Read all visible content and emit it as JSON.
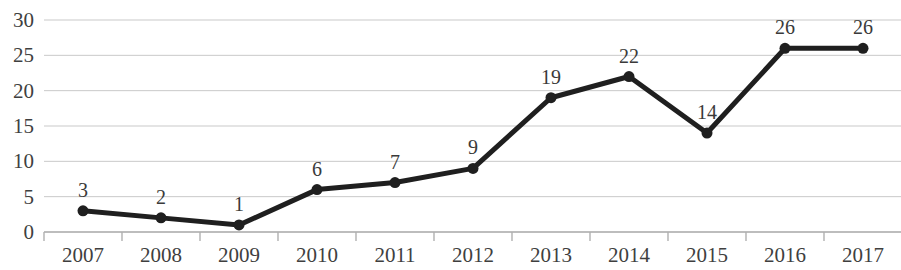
{
  "chart_data": {
    "type": "line",
    "title": "",
    "subtitle": "",
    "xlabel": "",
    "ylabel": "",
    "categories": [
      "2007",
      "2008",
      "2009",
      "2010",
      "2011",
      "2012",
      "2013",
      "2014",
      "2015",
      "2016",
      "2017"
    ],
    "values": [
      3,
      2,
      1,
      6,
      7,
      9,
      19,
      22,
      14,
      26,
      26
    ],
    "data_labels": [
      "3",
      "2",
      "1",
      "6",
      "7",
      "9",
      "19",
      "22",
      "14",
      "26",
      "26"
    ],
    "y_ticks": [
      0,
      5,
      10,
      15,
      20,
      25,
      30
    ],
    "y_tick_labels": [
      "0",
      "5",
      "10",
      "15",
      "20",
      "25",
      "30"
    ],
    "ylim": [
      0,
      30
    ],
    "grid": true,
    "grid_axis": "y",
    "legend": false,
    "legend_position": "none",
    "marker": "circle",
    "line_color": "#1f1f1f",
    "marker_color": "#1f1f1f",
    "grid_color": "#c9c9c9",
    "axis_color": "#b0b0b0",
    "text_color": "#3a3a3a",
    "background_color": "#ffffff"
  },
  "geometry": {
    "plot_left": 44,
    "plot_right": 901,
    "plot_top": 20,
    "plot_bottom": 232,
    "category_step": 78,
    "first_category_center": 83,
    "y_label_right": 34,
    "x_label_baseline_top": 245,
    "tick_length": 9,
    "line_width": 5,
    "marker_radius": 5.5,
    "data_label_offset": 11
  }
}
